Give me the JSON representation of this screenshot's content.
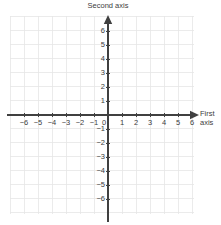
{
  "figure": {
    "background_color": "#ffffff",
    "grid_color": "#e6e6e6",
    "axis_color": "#404040",
    "label_color": "#3d3d3d"
  },
  "axis_titles": {
    "vertical": "Second axis",
    "horizontal_line1": "First",
    "horizontal_line2": "axis"
  },
  "chart_data": {
    "type": "scatter",
    "title": "",
    "subtitle": "",
    "xlabel": "First axis",
    "ylabel": "Second axis",
    "xlim": [
      -6.8,
      6.8
    ],
    "ylim": [
      -7.0,
      7.0
    ],
    "xticks": [
      -6,
      -5,
      -4,
      -3,
      -2,
      -1,
      0,
      1,
      2,
      3,
      4,
      5,
      6
    ],
    "yticks": [
      -6,
      -5,
      -4,
      -3,
      -2,
      -1,
      1,
      2,
      3,
      4,
      5,
      6
    ],
    "xtick_labels": [
      "−6",
      "−5",
      "−4",
      "−3",
      "−2",
      "−1",
      "0",
      "1",
      "2",
      "3",
      "4",
      "5",
      "6"
    ],
    "ytick_labels": [
      "−6",
      "−5",
      "−4",
      "−3",
      "−2",
      "−1",
      "1",
      "2",
      "3",
      "4",
      "5",
      "6"
    ],
    "origin_label": "0",
    "grid": true,
    "grid_step": 1,
    "legend": null,
    "series": [],
    "annotations": []
  }
}
